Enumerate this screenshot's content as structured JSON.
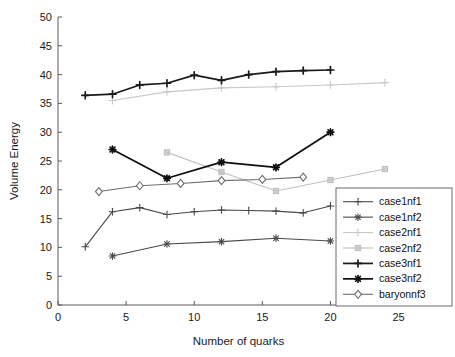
{
  "chart_data": {
    "type": "line",
    "title": "",
    "xlabel": "Number of quarks",
    "ylabel": "Volume Energy",
    "xlim": [
      0,
      26.5
    ],
    "ylim": [
      0,
      50
    ],
    "xticks": [
      0,
      5,
      10,
      15,
      20,
      25
    ],
    "yticks": [
      0,
      5,
      10,
      15,
      20,
      25,
      30,
      35,
      40,
      45,
      50
    ],
    "grid": false,
    "legend_position": "lower-right",
    "series": [
      {
        "name": "case1nf1",
        "color": "#4a4a4a",
        "marker": "plus",
        "x": [
          2,
          4,
          6,
          8,
          10,
          12,
          14,
          16,
          18,
          20
        ],
        "y": [
          10.1,
          16.2,
          16.9,
          15.7,
          16.2,
          16.5,
          16.4,
          16.3,
          16.0,
          17.2
        ]
      },
      {
        "name": "case1nf2",
        "color": "#4a4a4a",
        "marker": "star",
        "x": [
          4,
          8,
          12,
          16,
          20
        ],
        "y": [
          8.5,
          10.6,
          11.0,
          11.6,
          11.1
        ]
      },
      {
        "name": "case2nf1",
        "color": "#c8c8c8",
        "marker": "plus",
        "x": [
          4,
          8,
          12,
          16,
          20,
          24
        ],
        "y": [
          35.5,
          37.0,
          37.7,
          37.9,
          38.2,
          38.6
        ]
      },
      {
        "name": "case2nf2",
        "color": "#c0c0c0",
        "marker": "square",
        "x": [
          8,
          12,
          16,
          20,
          24
        ],
        "y": [
          26.5,
          23.1,
          19.8,
          21.7,
          23.6
        ]
      },
      {
        "name": "case3nf1",
        "color": "#1a1a1a",
        "marker": "plus",
        "x": [
          2,
          4,
          6,
          8,
          10,
          12,
          14,
          16,
          18,
          20
        ],
        "y": [
          36.4,
          36.6,
          38.2,
          38.5,
          39.9,
          39.0,
          40.0,
          40.5,
          40.7,
          40.8
        ]
      },
      {
        "name": "case3nf2",
        "color": "#0d0d0d",
        "marker": "star",
        "x": [
          4,
          8,
          12,
          16,
          20
        ],
        "y": [
          27.0,
          22.0,
          24.8,
          23.9,
          30.0
        ]
      },
      {
        "name": "baryonnf3",
        "color": "#6e6e6e",
        "marker": "diamond",
        "x": [
          3,
          6,
          9,
          12,
          15,
          18
        ],
        "y": [
          19.7,
          20.7,
          21.1,
          21.6,
          21.8,
          22.2
        ]
      }
    ]
  },
  "axes": {
    "x_tick_labels": [
      "0",
      "5",
      "10",
      "15",
      "20",
      "25"
    ],
    "y_tick_labels": [
      "0",
      "5",
      "10",
      "15",
      "20",
      "25",
      "30",
      "35",
      "40",
      "45",
      "50"
    ],
    "x_axis_title": "Number of quarks",
    "y_axis_title": "Volume Energy"
  },
  "legend": {
    "entries": [
      {
        "label": "case1nf1"
      },
      {
        "label": "case1nf2"
      },
      {
        "label": "case2nf1"
      },
      {
        "label": "case2nf2"
      },
      {
        "label": "case3nf1"
      },
      {
        "label": "case3nf2"
      },
      {
        "label": "baryonnf3"
      }
    ]
  }
}
